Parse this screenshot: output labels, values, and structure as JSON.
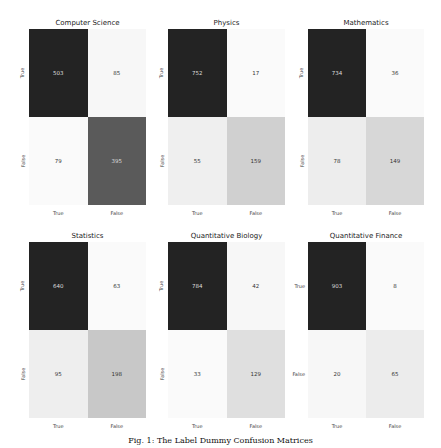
{
  "figure": {
    "caption": "Fig. 1: The Label Dummy Confusion Matrices"
  },
  "chart_data": [
    {
      "type": "heatmap",
      "title": "Computer Science",
      "xticks": [
        "True",
        "False"
      ],
      "yticks": [
        "True",
        "False"
      ],
      "matrix": [
        [
          503,
          85
        ],
        [
          79,
          395
        ]
      ]
    },
    {
      "type": "heatmap",
      "title": "Physics",
      "xticks": [
        "True",
        "False"
      ],
      "yticks": [
        "True",
        "False"
      ],
      "matrix": [
        [
          752,
          17
        ],
        [
          55,
          159
        ]
      ]
    },
    {
      "type": "heatmap",
      "title": "Mathematics",
      "xticks": [
        "True",
        "False"
      ],
      "yticks": [
        "True",
        "False"
      ],
      "matrix": [
        [
          734,
          36
        ],
        [
          78,
          149
        ]
      ]
    },
    {
      "type": "heatmap",
      "title": "Statistics",
      "xticks": [
        "True",
        "False"
      ],
      "yticks": [
        "True",
        "False"
      ],
      "matrix": [
        [
          640,
          63
        ],
        [
          95,
          198
        ]
      ]
    },
    {
      "type": "heatmap",
      "title": "Quantitative Biology",
      "xticks": [
        "True",
        "False"
      ],
      "yticks": [
        "True",
        "False"
      ],
      "matrix": [
        [
          784,
          42
        ],
        [
          33,
          129
        ]
      ]
    },
    {
      "type": "heatmap",
      "title": "Quantitative Finance",
      "xticks": [
        "True",
        "False"
      ],
      "yticks": [
        "True",
        "False"
      ],
      "matrix": [
        [
          903,
          8
        ],
        [
          20,
          65
        ]
      ]
    }
  ]
}
